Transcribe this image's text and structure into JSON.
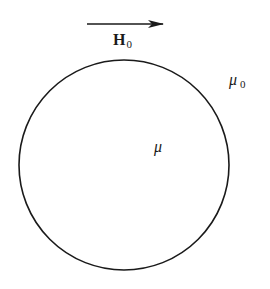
{
  "diagram": {
    "field_label": {
      "main": "H",
      "subscript": "0"
    },
    "outer_medium_label": {
      "symbol": "μ",
      "subscript": "0"
    },
    "inner_medium_label": {
      "symbol": "μ"
    },
    "arrow": {
      "direction": "right",
      "x1": 87,
      "y": 24,
      "x2": 163
    },
    "sphere": {
      "cx": 124,
      "cy": 165,
      "r": 105
    },
    "colors": {
      "stroke": "#1a1a1a",
      "background": "#ffffff"
    }
  }
}
